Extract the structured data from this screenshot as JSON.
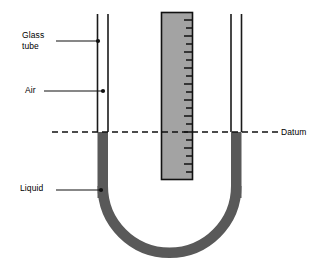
{
  "figure": {
    "background_color": "#ffffff",
    "line_color": "#000000",
    "liquid_color": "#595959",
    "scale_fill_color": "#a3a3a3",
    "width": 319,
    "height": 260
  },
  "labels": {
    "glass_tube": "Glass\ntube",
    "air": "Air",
    "liquid": "Liquid",
    "datum": "Datum"
  },
  "annotations": [
    {
      "name": "glass-tube",
      "text": "Glass\ntube",
      "leader_from_x": 56,
      "leader_from_y": 41,
      "leader_to_x": 97,
      "leader_to_y": 41,
      "dot_x": 97,
      "dot_y": 41
    },
    {
      "name": "air",
      "text": "Air",
      "leader_from_x": 44,
      "leader_from_y": 91,
      "leader_to_x": 103,
      "leader_to_y": 91,
      "dot_x": 103,
      "dot_y": 91
    },
    {
      "name": "liquid",
      "text": "Liquid",
      "leader_from_x": 56,
      "leader_from_y": 190,
      "leader_to_x": 101,
      "leader_to_y": 190,
      "dot_x": 101,
      "dot_y": 190
    }
  ],
  "datum_line": {
    "label": "Datum",
    "y": 132,
    "x_start": 52,
    "x_end": 278,
    "style": "dashed"
  },
  "left_tube": {
    "outer_x": 97,
    "inner_x": 108,
    "top_y": 14,
    "liquid_top_y": 132
  },
  "right_tube": {
    "inner_x": 231,
    "outer_x": 242,
    "top_y": 14,
    "liquid_top_y": 132
  },
  "scale": {
    "name": "measuring-scale",
    "left_x": 161,
    "right_x": 193,
    "top_y": 12,
    "bottom_y": 180,
    "tick_count": 21,
    "tick_side": "right"
  },
  "u_bend": {
    "center_x": 169,
    "center_y": 196,
    "radius": 61,
    "thickness": 11
  }
}
